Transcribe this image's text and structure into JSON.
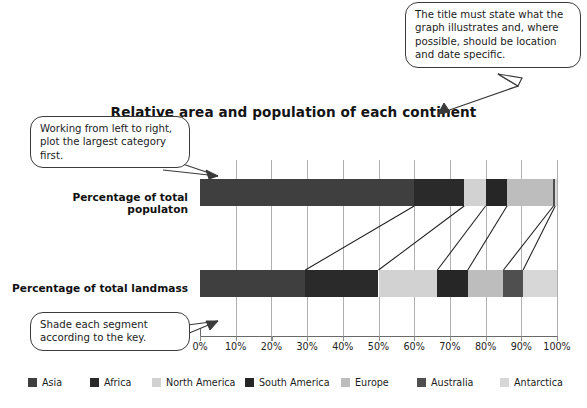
{
  "chart_data": {
    "type": "bar",
    "orientation": "horizontal",
    "stacked": true,
    "title": "Relative area and population of each continent",
    "xlabel": "",
    "ylabel": "",
    "xlim": [
      0,
      100
    ],
    "grid": true,
    "legend_position": "bottom",
    "categories": [
      "Percentage of total populaton",
      "Percentage of total landmass"
    ],
    "tick_labels": [
      "0%",
      "10%",
      "20%",
      "30%",
      "40%",
      "50%",
      "60%",
      "70%",
      "80%",
      "90%",
      "100%"
    ],
    "tick_values": [
      0,
      10,
      20,
      30,
      40,
      50,
      60,
      70,
      80,
      90,
      100
    ],
    "series": [
      {
        "name": "Asia",
        "color": "#3f3f3f",
        "values": [
          60.0,
          29.5
        ]
      },
      {
        "name": "Africa",
        "color": "#2a2a2a",
        "values": [
          14.0,
          20.5
        ]
      },
      {
        "name": "North America",
        "color": "#d2d2d2",
        "values": [
          6.0,
          16.5
        ]
      },
      {
        "name": "South America",
        "color": "#262626",
        "values": [
          6.0,
          8.5
        ]
      },
      {
        "name": "Europe",
        "color": "#bdbdbd",
        "values": [
          13.0,
          10.0
        ]
      },
      {
        "name": "Australia",
        "color": "#4f4f4f",
        "values": [
          0.5,
          5.5
        ]
      },
      {
        "name": "Antarctica",
        "color": "#d7d7d7",
        "values": [
          0.5,
          9.5
        ]
      }
    ]
  },
  "callouts": {
    "title_hint": "The title must state what the graph illustrates and, where possible, should be location and date specific.",
    "order_hint": "Working from left to right, plot the largest category first.",
    "shade_hint": "Shade each segment according to the key."
  }
}
